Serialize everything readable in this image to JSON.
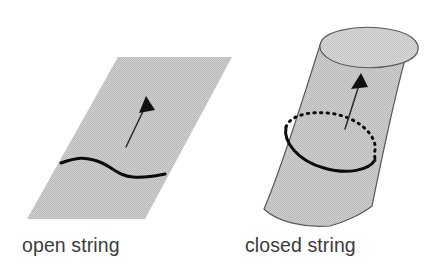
{
  "figure": {
    "background_color": "#ffffff",
    "width": 447,
    "height": 266
  },
  "palette": {
    "surface_fill": "#c9c9c9",
    "surface_fill_light": "#d2d2d2",
    "surface_outline": "#5a5a5a",
    "string_curve": "#0b0b0b",
    "arrow": "#2a2a2a",
    "caption": "#3b3b3b"
  },
  "panels": [
    {
      "id": "open-string-panel",
      "caption": "open string",
      "caption_x": 22,
      "caption_y": 252,
      "surface": {
        "shape": "parallelogram",
        "name": "open-string-worldsheet",
        "points": "118,57 232,57 145,219 27,219",
        "fill": "#c9c9c9"
      },
      "string": {
        "name": "open-string-curve",
        "type": "open-wavy-curve",
        "path": "M 61,163 C 78,157 84,157 97,161 C 112,166 118,176 133,177 C 147,178 155,176 165,174",
        "stroke_width": 3.1
      },
      "arrow": {
        "name": "time-direction-arrow",
        "shaft": "M 126,147 L 146,105",
        "head": "146,96 139,113 155,110",
        "stroke_width": 1.5
      }
    },
    {
      "id": "closed-string-panel",
      "caption": "closed string",
      "caption_x": 245,
      "caption_y": 252,
      "surface": {
        "shape": "cylinder",
        "name": "closed-string-worldsheet",
        "body_path": "M 321,42 C 303,98 283,165 264,209 C 277,222 305,228 330,226 C 345,222 362,214 372,206 C 383,152 395,95 406,56 C 392,46 360,38 338,39 Z",
        "top_cap_path": "M 321,42 C 325,32 352,25 381,28 C 410,31 422,42 417,53 C 412,63 385,70 356,67 C 329,64 316,52 321,42 Z",
        "fill": "#c9c9c9",
        "cap_fill": "#d2d2d2"
      },
      "string": {
        "name": "closed-string-ring",
        "type": "closed-loop-ellipse",
        "front_arc": "M 286,127 C 283,142 298,161 324,168 C 348,175 369,170 375,160",
        "back_arc": "M 286,127 C 290,115 311,110 335,114 C 360,119 377,136 375,150 C 374,155 375,157 375,160",
        "back_dash": "1.4 5.2",
        "stroke_width": 3.0,
        "back_stroke_width": 3.0
      },
      "arrow": {
        "name": "time-direction-arrow",
        "shaft": "M 345,129 L 360,82",
        "head": "361,73 351,89 368,87",
        "stroke_width": 1.5
      }
    }
  ]
}
